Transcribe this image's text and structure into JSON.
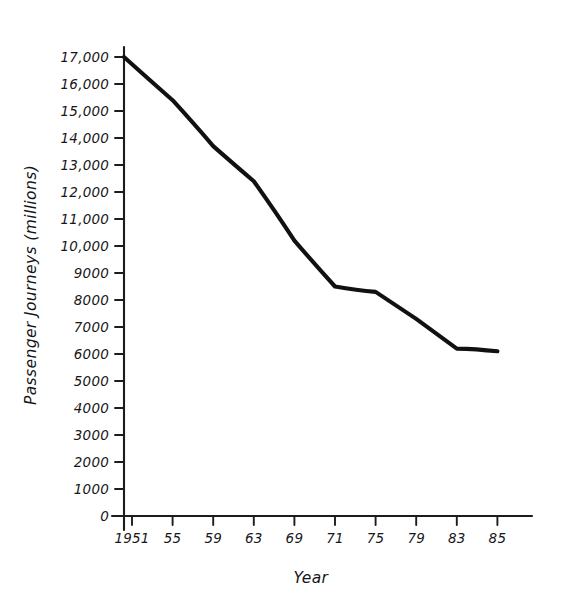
{
  "chart_data": {
    "type": "line",
    "title": "",
    "xlabel": "Year",
    "ylabel": "Passenger Journeys (millions)",
    "x": [
      1951,
      1955,
      1959,
      1963,
      1969,
      1971,
      1975,
      1979,
      1983,
      1985
    ],
    "categories": [
      "1951",
      "55",
      "59",
      "63",
      "69",
      "71",
      "75",
      "79",
      "83",
      "85"
    ],
    "values": [
      17000,
      15400,
      13700,
      12400,
      10200,
      8500,
      8300,
      7300,
      6200,
      6100
    ],
    "series": [
      {
        "name": "Passenger Journeys",
        "values": [
          17000,
          15400,
          13700,
          12400,
          10200,
          8500,
          8300,
          7300,
          6200,
          6100
        ]
      }
    ],
    "ylim": [
      0,
      17000
    ],
    "ytick_labels": [
      "0",
      "1000",
      "2000",
      "3000",
      "4000",
      "5000",
      "6000",
      "7000",
      "8000",
      "9000",
      "10,000",
      "11,000",
      "12,000",
      "13,000",
      "14,000",
      "15,000",
      "16,000",
      "17,000"
    ],
    "ytick_values": [
      0,
      1000,
      2000,
      3000,
      4000,
      5000,
      6000,
      7000,
      8000,
      9000,
      10000,
      11000,
      12000,
      13000,
      14000,
      15000,
      16000,
      17000
    ],
    "xtick_labels": [
      "1951",
      "55",
      "59",
      "63",
      "69",
      "71",
      "75",
      "79",
      "83",
      "85"
    ],
    "grid": false,
    "legend": false,
    "line_color": "#111111",
    "axis_color": "#1c1c1c",
    "background_color": "#ffffff",
    "style": "hand-drawn"
  }
}
